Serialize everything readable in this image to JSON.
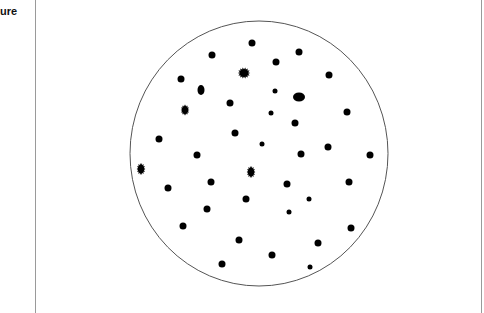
{
  "caption": {
    "text": "ure"
  },
  "panel": {
    "left_border_x": 35,
    "right_border_x": 481,
    "border_color": "#9a9a9a"
  },
  "dish": {
    "cx": 259,
    "cy": 153.5,
    "rx": 129,
    "ry": 132.5,
    "stroke": "#555555",
    "stroke_width": 1
  },
  "dot_color": "#000000",
  "dots": [
    {
      "x": 212,
      "y": 55,
      "rx": 3.5,
      "ry": 3.5,
      "shape": "round"
    },
    {
      "x": 252,
      "y": 43,
      "rx": 3.5,
      "ry": 3.5,
      "shape": "round"
    },
    {
      "x": 299,
      "y": 52,
      "rx": 3.5,
      "ry": 3.5,
      "shape": "round"
    },
    {
      "x": 276,
      "y": 62,
      "rx": 3.5,
      "ry": 3.5,
      "shape": "round"
    },
    {
      "x": 181,
      "y": 79,
      "rx": 3.5,
      "ry": 3.5,
      "shape": "round"
    },
    {
      "x": 329,
      "y": 75,
      "rx": 3.5,
      "ry": 3.5,
      "shape": "round"
    },
    {
      "x": 201,
      "y": 90,
      "rx": 3.5,
      "ry": 5,
      "shape": "round"
    },
    {
      "x": 244,
      "y": 73,
      "rx": 5,
      "ry": 4.5,
      "shape": "spiky"
    },
    {
      "x": 275,
      "y": 91,
      "rx": 2.5,
      "ry": 2.5,
      "shape": "round"
    },
    {
      "x": 299,
      "y": 97,
      "rx": 6,
      "ry": 4.5,
      "shape": "round"
    },
    {
      "x": 230,
      "y": 103,
      "rx": 3.5,
      "ry": 3.5,
      "shape": "round"
    },
    {
      "x": 185,
      "y": 110,
      "rx": 3.5,
      "ry": 4.5,
      "shape": "spiky"
    },
    {
      "x": 271,
      "y": 113,
      "rx": 2.5,
      "ry": 2.5,
      "shape": "round"
    },
    {
      "x": 347,
      "y": 112,
      "rx": 3.5,
      "ry": 3.5,
      "shape": "round"
    },
    {
      "x": 295,
      "y": 123,
      "rx": 3.5,
      "ry": 3.5,
      "shape": "round"
    },
    {
      "x": 235,
      "y": 133,
      "rx": 3.5,
      "ry": 3.5,
      "shape": "round"
    },
    {
      "x": 159,
      "y": 139,
      "rx": 3.5,
      "ry": 3.5,
      "shape": "round"
    },
    {
      "x": 262,
      "y": 144,
      "rx": 2.5,
      "ry": 2.5,
      "shape": "round"
    },
    {
      "x": 328,
      "y": 147,
      "rx": 3.5,
      "ry": 3.5,
      "shape": "round"
    },
    {
      "x": 197,
      "y": 155,
      "rx": 3.5,
      "ry": 3.5,
      "shape": "round"
    },
    {
      "x": 301,
      "y": 154,
      "rx": 3.5,
      "ry": 3.5,
      "shape": "round"
    },
    {
      "x": 370,
      "y": 155,
      "rx": 3.5,
      "ry": 3.5,
      "shape": "round"
    },
    {
      "x": 141,
      "y": 169,
      "rx": 3.5,
      "ry": 5,
      "shape": "spiky"
    },
    {
      "x": 251,
      "y": 172,
      "rx": 3.5,
      "ry": 5,
      "shape": "spiky"
    },
    {
      "x": 211,
      "y": 182,
      "rx": 3.5,
      "ry": 3.5,
      "shape": "round"
    },
    {
      "x": 287,
      "y": 184,
      "rx": 3.5,
      "ry": 3.5,
      "shape": "round"
    },
    {
      "x": 349,
      "y": 182,
      "rx": 3.5,
      "ry": 3.5,
      "shape": "round"
    },
    {
      "x": 168,
      "y": 188,
      "rx": 3.5,
      "ry": 3.5,
      "shape": "round"
    },
    {
      "x": 246,
      "y": 199,
      "rx": 3.5,
      "ry": 3.5,
      "shape": "round"
    },
    {
      "x": 309,
      "y": 199,
      "rx": 2.5,
      "ry": 2.5,
      "shape": "round"
    },
    {
      "x": 207,
      "y": 209,
      "rx": 3.5,
      "ry": 3.5,
      "shape": "round"
    },
    {
      "x": 289,
      "y": 212,
      "rx": 2.5,
      "ry": 2.5,
      "shape": "round"
    },
    {
      "x": 183,
      "y": 226,
      "rx": 3.5,
      "ry": 3.5,
      "shape": "round"
    },
    {
      "x": 351,
      "y": 228,
      "rx": 3.5,
      "ry": 3.5,
      "shape": "round"
    },
    {
      "x": 239,
      "y": 240,
      "rx": 3.5,
      "ry": 3.5,
      "shape": "round"
    },
    {
      "x": 318,
      "y": 243,
      "rx": 3.5,
      "ry": 3.5,
      "shape": "round"
    },
    {
      "x": 272,
      "y": 255,
      "rx": 3.5,
      "ry": 3.5,
      "shape": "round"
    },
    {
      "x": 222,
      "y": 264,
      "rx": 3.5,
      "ry": 3.5,
      "shape": "round"
    },
    {
      "x": 310,
      "y": 267,
      "rx": 2.5,
      "ry": 2.5,
      "shape": "round"
    }
  ]
}
